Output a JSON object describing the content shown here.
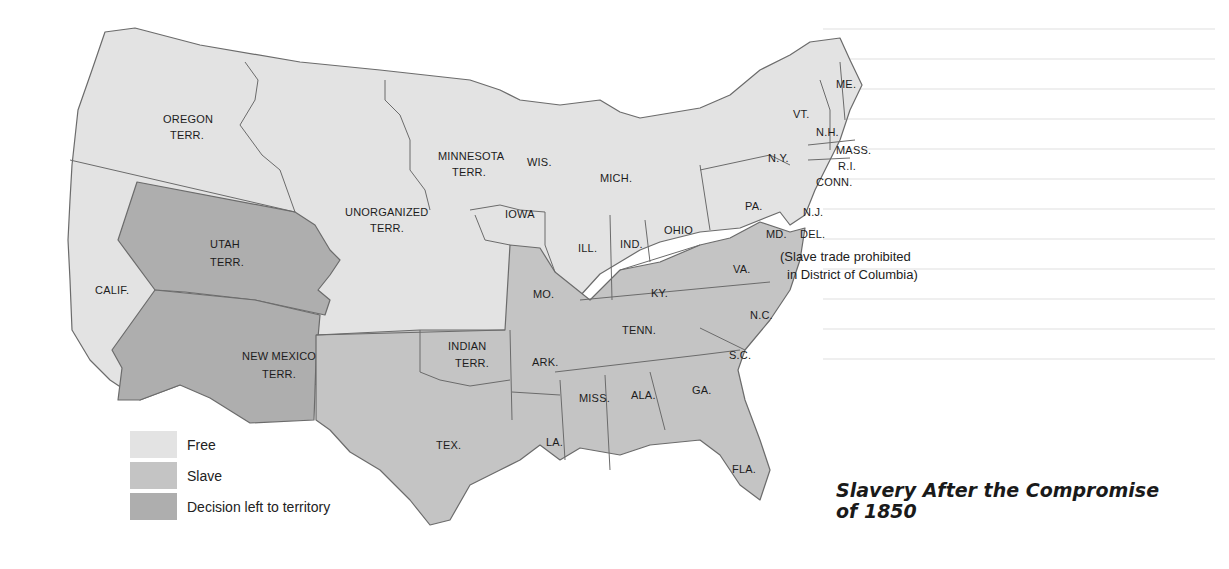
{
  "title": {
    "line1": "Slavery After the Compromise",
    "line2": "of 1850"
  },
  "colors": {
    "free": "#e3e3e3",
    "slave": "#c4c4c4",
    "territory": "#aeaeae",
    "border": "#6b6b6b",
    "background": "#ffffff"
  },
  "legend": [
    {
      "label": "Free",
      "category": "free"
    },
    {
      "label": "Slave",
      "category": "slave"
    },
    {
      "label": "Decision left to territory",
      "category": "territory"
    }
  ],
  "annotation": {
    "line1": "(Slave trade prohibited",
    "line2": "in District of Columbia)"
  },
  "regions": {
    "oregon": [
      "OREGON",
      "TERR."
    ],
    "minnesota": [
      "MINNESOTA",
      "TERR."
    ],
    "unorganized": [
      "UNORGANIZED",
      "TERR."
    ],
    "utah": [
      "UTAH",
      "TERR."
    ],
    "newmexico": [
      "NEW MEXICO",
      "TERR."
    ],
    "indian": [
      "INDIAN",
      "TERR."
    ],
    "calif": "CALIF.",
    "wis": "WIS.",
    "mich": "MICH.",
    "iowa": "IOWA",
    "ill": "ILL.",
    "ind": "IND.",
    "ohio": "OHIO",
    "mo": "MO.",
    "ky": "KY.",
    "va": "VA.",
    "nc": "N.C.",
    "tenn": "TENN.",
    "ark": "ARK.",
    "sc": "S.C.",
    "miss": "MISS.",
    "ala": "ALA.",
    "ga": "GA.",
    "la": "LA.",
    "tex": "TEX.",
    "fla": "FLA.",
    "me": "ME.",
    "vt": "VT.",
    "nh": "N.H.",
    "mass": "MASS.",
    "ri": "R.I.",
    "conn": "CONN.",
    "ny": "N.Y.",
    "pa": "PA.",
    "nj": "N.J.",
    "md": "MD.",
    "del": "DEL."
  }
}
